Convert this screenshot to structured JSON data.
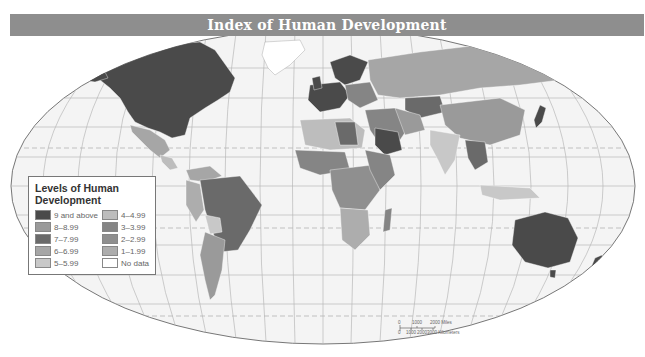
{
  "title": "Index of Human Development",
  "legend": {
    "title": "Levels of Human Development",
    "items": [
      {
        "label": "9 and above",
        "color": "#4a4a4a"
      },
      {
        "label": "8–8.99",
        "color": "#9a9a9a"
      },
      {
        "label": "7–7.99",
        "color": "#6a6a6a"
      },
      {
        "label": "6–6.99",
        "color": "#a6a6a6"
      },
      {
        "label": "5–5.99",
        "color": "#c8c8c8"
      },
      {
        "label": "4–4.99",
        "color": "#bdbdbd"
      },
      {
        "label": "3–3.99",
        "color": "#858585"
      },
      {
        "label": "2–2.99",
        "color": "#8f8f8f"
      },
      {
        "label": "1–1.99",
        "color": "#adadad"
      },
      {
        "label": "No data",
        "color": "#ffffff"
      }
    ]
  },
  "scale_bar": {
    "miles_labels": [
      "0",
      "1000",
      "2000 Miles"
    ],
    "km_labels": [
      "0",
      "1000",
      "2000",
      "3000 Kilometers"
    ]
  },
  "colors": {
    "title_bar": "#8e8e8e",
    "ocean": "#f4f4f4",
    "graticule": "#b8b8b8"
  }
}
